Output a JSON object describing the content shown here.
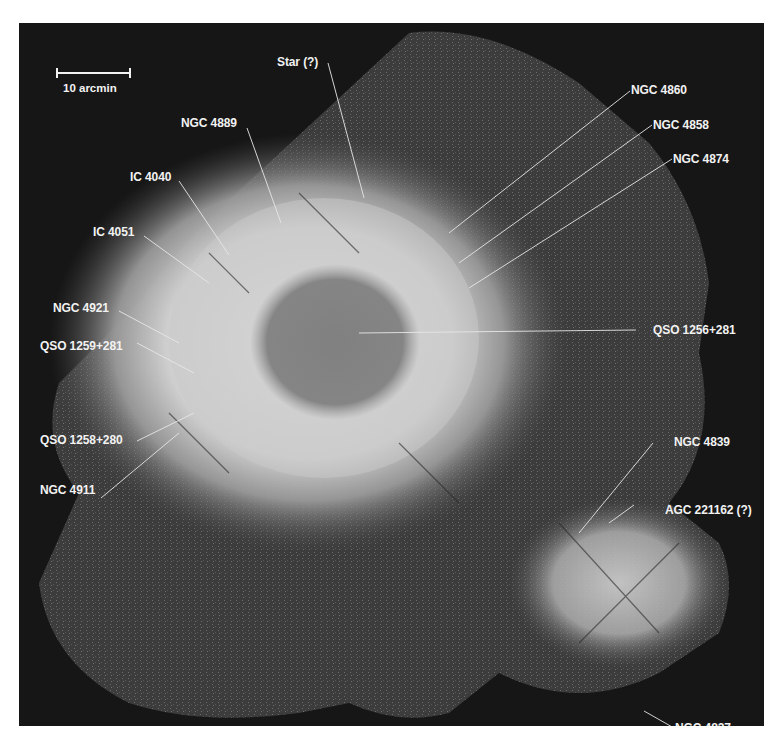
{
  "figure": {
    "background_color": "#161616",
    "label_color": "#f2f2f2",
    "scale_bar": {
      "label": "10 arcmin"
    },
    "labels": [
      {
        "id": "star",
        "text": "Star (?)"
      },
      {
        "id": "ngc4889",
        "text": "NGC 4889"
      },
      {
        "id": "ic4040",
        "text": "IC 4040"
      },
      {
        "id": "ic4051",
        "text": "IC 4051"
      },
      {
        "id": "ngc4921",
        "text": "NGC 4921"
      },
      {
        "id": "qso1259",
        "text": "QSO 1259+281"
      },
      {
        "id": "qso1258",
        "text": "QSO 1258+280"
      },
      {
        "id": "ngc4911",
        "text": "NGC 4911"
      },
      {
        "id": "ngc4860",
        "text": "NGC 4860"
      },
      {
        "id": "ngc4858",
        "text": "NGC 4858"
      },
      {
        "id": "ngc4874",
        "text": "NGC 4874"
      },
      {
        "id": "qso1256",
        "text": "QSO 1256+281"
      },
      {
        "id": "ngc4839",
        "text": "NGC 4839"
      },
      {
        "id": "agc221162",
        "text": "AGC 221162 (?)"
      },
      {
        "id": "ngc4827",
        "text": "NGC 4827"
      }
    ]
  }
}
